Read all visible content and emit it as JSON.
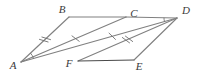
{
  "figure": {
    "kind": "geometry-diagram",
    "canvas": {
      "width": 198,
      "height": 76
    },
    "background_color": "#ffffff",
    "line_color": "#808080",
    "line_color_dark": "#4a4a4a",
    "tick_color": "#6e6e6e",
    "label_color": "#3a3a3a",
    "stroke_width": 1.1,
    "vertices": [
      {
        "name": "A",
        "label": "A",
        "x": 21,
        "y": 62,
        "label_x": 13,
        "label_y": 66
      },
      {
        "name": "B",
        "label": "B",
        "x": 69,
        "y": 17,
        "label_x": 62,
        "label_y": 10
      },
      {
        "name": "C",
        "label": "C",
        "x": 126,
        "y": 17,
        "label_x": 134,
        "label_y": 14
      },
      {
        "name": "D",
        "label": "D",
        "x": 177,
        "y": 18,
        "label_x": 186,
        "label_y": 11
      },
      {
        "name": "E",
        "label": "E",
        "x": 134,
        "y": 60,
        "label_x": 139,
        "label_y": 67
      },
      {
        "name": "F",
        "label": "F",
        "x": 78,
        "y": 61,
        "label_x": 69,
        "label_y": 64
      }
    ],
    "segments": [
      {
        "name": "segment-AB",
        "from": "A",
        "to": "B",
        "shade": "light"
      },
      {
        "name": "segment-BC",
        "from": "B",
        "to": "C",
        "shade": "light"
      },
      {
        "name": "segment-CD",
        "from": "C",
        "to": "D",
        "shade": "light"
      },
      {
        "name": "segment-AD",
        "from": "A",
        "to": "D",
        "shade": "light"
      },
      {
        "name": "segment-AC",
        "from": "A",
        "to": "C",
        "shade": "light"
      },
      {
        "name": "segment-FD",
        "from": "F",
        "to": "D",
        "shade": "light"
      },
      {
        "name": "segment-FE",
        "from": "F",
        "to": "E",
        "shade": "dark"
      },
      {
        "name": "segment-ED",
        "from": "E",
        "to": "D",
        "shade": "light"
      }
    ],
    "tick_marks": [
      {
        "name": "tick-AB-double",
        "on_segment": "segment-AB",
        "count": 2,
        "t": 0.5,
        "length": 9,
        "spacing": 3.4
      },
      {
        "name": "tick-AC-single",
        "on_segment": "segment-AC",
        "count": 1,
        "t": 0.52,
        "length": 9,
        "spacing": 0
      },
      {
        "name": "tick-AD-single",
        "on_segment": "segment-AD",
        "count": 1,
        "t": 0.585,
        "length": 9,
        "spacing": 0
      },
      {
        "name": "tick-FD-double",
        "on_segment": "segment-FD",
        "count": 2,
        "t": 0.5,
        "length": 9,
        "spacing": 3.4
      }
    ],
    "angle_arcs": [
      {
        "name": "angle-arc-at-A",
        "at": "A",
        "toward_a": "B",
        "toward_b": "D",
        "radius": 13
      },
      {
        "name": "angle-arc-at-D",
        "at": "D",
        "toward_a": "C",
        "toward_b": "A",
        "radius": 13
      }
    ]
  }
}
